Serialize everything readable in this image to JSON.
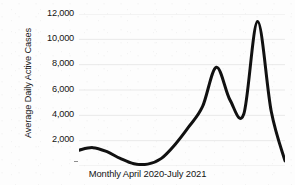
{
  "chart_data": {
    "type": "line",
    "title": "",
    "xlabel": "Monthly April 2020-July 2021",
    "ylabel": "Average Daily Active Cases",
    "ylim": [
      0,
      12000
    ],
    "ytick_labels": [
      "12,000",
      "10,000",
      "8,000",
      "6,000",
      "4,000",
      "2,000"
    ],
    "ytick_values": [
      12000,
      10000,
      8000,
      6000,
      4000,
      2000
    ],
    "grid": true,
    "grid_color": "#e9e9e9",
    "legend": "none",
    "line_color": "#111111",
    "line_width": 3,
    "categories": [
      "Apr 2020",
      "May 2020",
      "Jun 2020",
      "Jul 2020",
      "Aug 2020",
      "Sep 2020",
      "Oct 2020",
      "Nov 2020",
      "Dec 2020",
      "Jan 2021",
      "Feb 2021",
      "Mar 2021",
      "Apr 2021",
      "May 2021",
      "Jun 2021",
      "Jul 2021"
    ],
    "values": [
      1250,
      1450,
      1150,
      600,
      180,
      150,
      600,
      1700,
      3100,
      4700,
      7800,
      5200,
      4100,
      11400,
      4300,
      400
    ],
    "annotations": [
      "First peak approximately 7,800",
      "Intermediate trough approximately 4,100",
      "Maximum peak approximately 11,400",
      "Series ends near 400"
    ]
  },
  "axes": {
    "y_title": "Average Daily Active Cases",
    "x_title": "Monthly April 2020-July 2021"
  }
}
